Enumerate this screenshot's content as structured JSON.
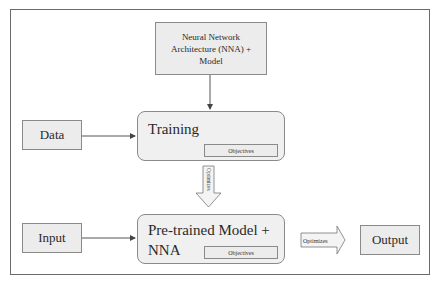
{
  "diagram": {
    "nodes": {
      "nna": {
        "line1": "Neural Network",
        "line2": "Architecture (NNA) +",
        "line3": "Model"
      },
      "data": {
        "label": "Data"
      },
      "training": {
        "label": "Training",
        "objectives": "Objectives"
      },
      "input": {
        "label": "Input"
      },
      "pretrained": {
        "line1": "Pre-trained Model +",
        "line2": "NNA",
        "objectives": "Objectives"
      },
      "output": {
        "label": "Output"
      }
    },
    "arrows": {
      "down_optimizes": "Optimizes",
      "right_optimizes": "Optimizes"
    },
    "colors": {
      "box_fill": "#ececec",
      "rounded_fill": "#f0f0f0",
      "stroke": "#8a8a8a",
      "arrow": "#444444"
    }
  }
}
